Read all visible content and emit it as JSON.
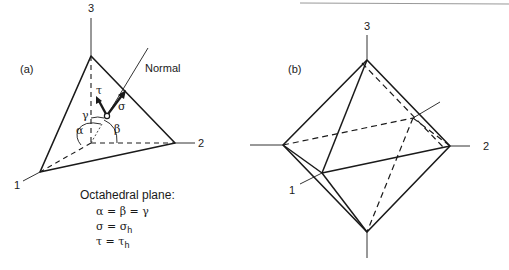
{
  "panel_a": {
    "label": "(a)",
    "axis_labels": {
      "x1": "1",
      "x2": "2",
      "x3": "3"
    },
    "normal_label": "Normal",
    "vector_labels": {
      "shear": "τ",
      "normal_stress": "σ"
    },
    "angle_labels": {
      "alpha": "α",
      "beta": "β",
      "gamma": "γ"
    },
    "caption": {
      "title": "Octahedral plane:",
      "eq1": "α = β = γ",
      "eq2_lhs": "σ = σ",
      "eq2_sub": "h",
      "eq3_lhs": "τ = τ",
      "eq3_sub": "h"
    }
  },
  "panel_b": {
    "label": "(b)",
    "axis_labels": {
      "x1": "1",
      "x2": "2",
      "x3": "3"
    }
  },
  "colors": {
    "line": "#1a1a1a",
    "thin_line": "#333333",
    "top_rule": "#888888"
  }
}
